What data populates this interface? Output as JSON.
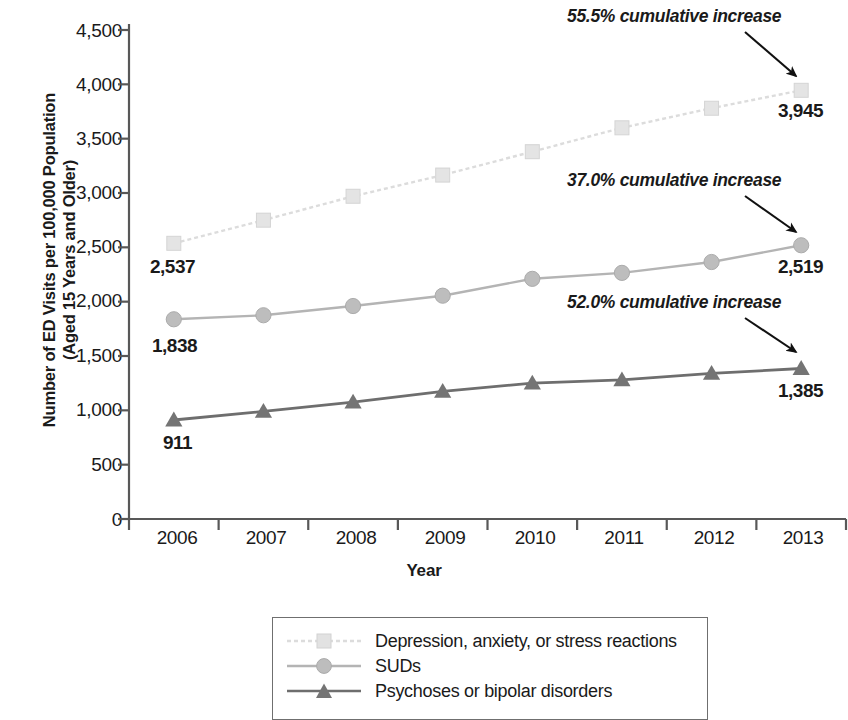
{
  "chart_data": {
    "type": "line",
    "title": "",
    "xlabel": "Year",
    "ylabel": "Number of ED Visits per 100,000 Population (Aged 15 Years and Older)",
    "ylabel_lines": [
      "Number of ED Visits per 100,000 Population",
      "(Aged 15 Years and Older)"
    ],
    "categories": [
      "2006",
      "2007",
      "2008",
      "2009",
      "2010",
      "2011",
      "2012",
      "2013"
    ],
    "x": [
      2006,
      2007,
      2008,
      2009,
      2010,
      2011,
      2012,
      2013
    ],
    "ylim": [
      0,
      4500
    ],
    "yticks": [
      0,
      500,
      1000,
      1500,
      2000,
      2500,
      3000,
      3500,
      4000,
      4500
    ],
    "ytick_labels": [
      "0",
      "500",
      "1,000",
      "1,500",
      "2,000",
      "2,500",
      "3,000",
      "3,500",
      "4,000",
      "4,500"
    ],
    "grid": false,
    "legend_position": "bottom",
    "series": [
      {
        "name": "Depression, anxiety, or stress reactions",
        "values": [
          2537,
          2750,
          2970,
          3165,
          3380,
          3600,
          3780,
          3945
        ],
        "color": "#dcdcdc",
        "marker": "square",
        "linestyle": "dotted",
        "start_label": "2,537",
        "end_label": "3,945",
        "annotation": "55.5% cumulative increase"
      },
      {
        "name": "SUDs",
        "values": [
          1838,
          1875,
          1960,
          2055,
          2210,
          2265,
          2365,
          2519
        ],
        "color": "#b4b4b4",
        "marker": "circle",
        "linestyle": "solid",
        "start_label": "1,838",
        "end_label": "2,519",
        "annotation": "37.0% cumulative increase"
      },
      {
        "name": "Psychoses or bipolar disorders",
        "values": [
          911,
          990,
          1075,
          1175,
          1250,
          1280,
          1340,
          1385
        ],
        "color": "#6e6e6e",
        "marker": "triangle",
        "linestyle": "solid",
        "start_label": "911",
        "end_label": "1,385",
        "annotation": "52.0% cumulative increase"
      }
    ]
  },
  "axis": {
    "y_title_line1": "Number of ED Visits per 100,000 Population",
    "y_title_line2": "(Aged 15 Years and Older)",
    "x_title": "Year",
    "y_labels": [
      "4,500",
      "4,000",
      "3,500",
      "3,000",
      "2,500",
      "2,000",
      "1,500",
      "1,000",
      "500",
      "0"
    ],
    "x_labels": [
      "2006",
      "2007",
      "2008",
      "2009",
      "2010",
      "2011",
      "2012",
      "2013"
    ]
  },
  "annotations": [
    {
      "text": "55.5% cumulative increase"
    },
    {
      "text": "37.0% cumulative increase"
    },
    {
      "text": "52.0% cumulative increase"
    }
  ],
  "value_labels": {
    "depression_start": "2,537",
    "depression_end": "3,945",
    "suds_start": "1,838",
    "suds_end": "2,519",
    "psychoses_start": "911",
    "psychoses_end": "1,385"
  },
  "legend": {
    "items": [
      {
        "label": "Depression, anxiety, or stress reactions"
      },
      {
        "label": "SUDs"
      },
      {
        "label": "Psychoses or bipolar disorders"
      }
    ]
  },
  "colors": {
    "depression": "#dcdcdc",
    "suds": "#b4b4b4",
    "psychoses": "#6e6e6e",
    "axis": "#585858",
    "text": "#1a1a1a"
  }
}
